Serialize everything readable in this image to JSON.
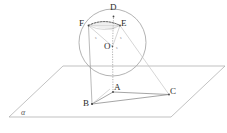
{
  "figure": {
    "kind": "solid-geometry-diagram",
    "canvas": {
      "width": 227,
      "height": 133
    },
    "colors": {
      "stroke": "#9a9a9a",
      "stroke_light": "#c2c2c2",
      "stroke_dark": "#6e6e6e",
      "dotted": "#4a4a4a",
      "fill_cap": "#ededed",
      "label": "#2b2b2b",
      "background": "#ffffff"
    },
    "sphere": {
      "center": {
        "x": 112.5,
        "y": 42.5
      },
      "radius": 33.5,
      "label": ""
    },
    "plane": {
      "name": "alpha",
      "label": "α",
      "label_pos": {
        "x": 21,
        "y": 109
      },
      "corners": [
        {
          "x": 63,
          "y": 66
        },
        {
          "x": 225,
          "y": 66
        },
        {
          "x": 171,
          "y": 117
        },
        {
          "x": 9,
          "y": 117
        }
      ]
    },
    "points": [
      {
        "id": "D",
        "label": "D",
        "x": 113.5,
        "y": 16.5,
        "label_x": 110,
        "label_y": 3
      },
      {
        "id": "F",
        "label": "F",
        "x": 88.5,
        "y": 25.5,
        "label_x": 79,
        "label_y": 19
      },
      {
        "id": "E",
        "label": "E",
        "x": 120.0,
        "y": 25.5,
        "label_x": 121,
        "label_y": 19
      },
      {
        "id": "O",
        "label": "O",
        "x": 112.5,
        "y": 46.5,
        "label_x": 104,
        "label_y": 42
      },
      {
        "id": "A",
        "label": "A",
        "x": 113.0,
        "y": 92.0,
        "label_x": 114,
        "label_y": 83
      },
      {
        "id": "B",
        "label": "B",
        "x": 92.0,
        "y": 104.0,
        "label_x": 83,
        "label_y": 99
      },
      {
        "id": "C",
        "label": "C",
        "x": 169.0,
        "y": 94.5,
        "label_x": 170,
        "label_y": 87
      }
    ],
    "small_marks": [
      {
        "label": "s",
        "x": 95,
        "y": 36
      },
      {
        "label": "s",
        "x": 120,
        "y": 36
      },
      {
        "label": "s",
        "x": 116,
        "y": 46
      }
    ],
    "segments": [
      {
        "from": "O",
        "to": "F",
        "style": "solid-light"
      },
      {
        "from": "O",
        "to": "E",
        "style": "solid-light"
      },
      {
        "from": "O",
        "to": "D",
        "style": "dotted"
      },
      {
        "from": "O",
        "to": "A",
        "style": "dotted"
      },
      {
        "from": "F",
        "to": "B",
        "style": "solid"
      },
      {
        "from": "E",
        "to": "C",
        "style": "solid-light"
      },
      {
        "from": "F",
        "to": "E",
        "style": "solid-light"
      },
      {
        "from": "A",
        "to": "B",
        "style": "solid"
      },
      {
        "from": "B",
        "to": "C",
        "style": "solid"
      },
      {
        "from": "A",
        "to": "C",
        "style": "solid"
      },
      {
        "from": "D",
        "to": "A",
        "style": "dotted-vertical"
      }
    ]
  }
}
